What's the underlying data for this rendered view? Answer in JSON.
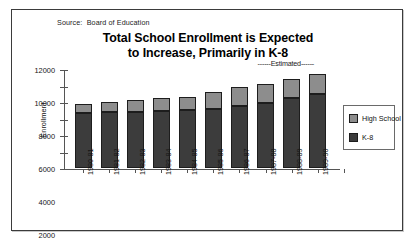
{
  "source_note": "Source:  Board of Education",
  "title_line1": "Total School Enrollment is Expected",
  "title_line2": "to Increase, Primarily in K-8",
  "estimated_note": "------Estimated------",
  "legend": {
    "high_school": "High School",
    "k8": "K-8"
  },
  "colors": {
    "high_school": "#8d8d8d",
    "k8": "#3c3c3c",
    "frame": "#3b3b3b",
    "axis": "#555555"
  },
  "chart_data": {
    "type": "bar",
    "stacked": true,
    "title": "Total School Enrollment is Expected to Increase, Primarily in K-8",
    "xlabel": "",
    "ylabel": "Enrollment",
    "ylim": [
      0,
      12000
    ],
    "yticks": [
      0,
      2000,
      4000,
      6000,
      8000,
      10000,
      12000
    ],
    "ytick_labels": [
      "0",
      "2000",
      "4000",
      "6000",
      "8000",
      "10000",
      "12000"
    ],
    "grid": false,
    "legend_position": "right",
    "categories": [
      "1980-81",
      "1981-82",
      "1982-83",
      "1983-84",
      "1984-85",
      "1985-86",
      "1986-87",
      "1987-88",
      "1988-89",
      "1989-90"
    ],
    "series": [
      {
        "name": "K-8",
        "color": "#3c3c3c",
        "values": [
          6700,
          6750,
          6850,
          6950,
          7000,
          7200,
          7500,
          7900,
          8500,
          9000
        ]
      },
      {
        "name": "High School",
        "color": "#8d8d8d",
        "values": [
          1100,
          1250,
          1400,
          1500,
          1600,
          2000,
          2300,
          2300,
          2300,
          2400
        ]
      }
    ],
    "totals": [
      7800,
      8000,
      8250,
      8450,
      8600,
      9200,
      9800,
      10200,
      10800,
      11400
    ],
    "annotations": [
      {
        "text": "------Estimated------",
        "applies_to": [
          "1987-88",
          "1988-89",
          "1989-90"
        ]
      }
    ]
  }
}
